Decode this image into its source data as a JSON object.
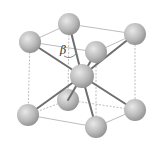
{
  "diagram": {
    "type": "crystal-structure",
    "structure": "body-centered-cubic",
    "angle_label": "β",
    "colors": {
      "sphere_fill": "#b8b8b8",
      "sphere_highlight": "#e6e6e6",
      "bond": "#6e6e6e",
      "cube_edge": "#9a9a9a"
    },
    "atoms": [
      {
        "id": "top-back-left",
        "x": 69,
        "y": 24
      },
      {
        "id": "top-back-right",
        "x": 135,
        "y": 34
      },
      {
        "id": "top-front-left",
        "x": 30,
        "y": 42
      },
      {
        "id": "top-front-right",
        "x": 96,
        "y": 52
      },
      {
        "id": "center",
        "x": 82,
        "y": 76
      },
      {
        "id": "bottom-back-left",
        "x": 68,
        "y": 100
      },
      {
        "id": "bottom-back-right",
        "x": 135,
        "y": 110
      },
      {
        "id": "bottom-front-left",
        "x": 28,
        "y": 115
      },
      {
        "id": "bottom-front-right",
        "x": 96,
        "y": 127
      }
    ]
  }
}
